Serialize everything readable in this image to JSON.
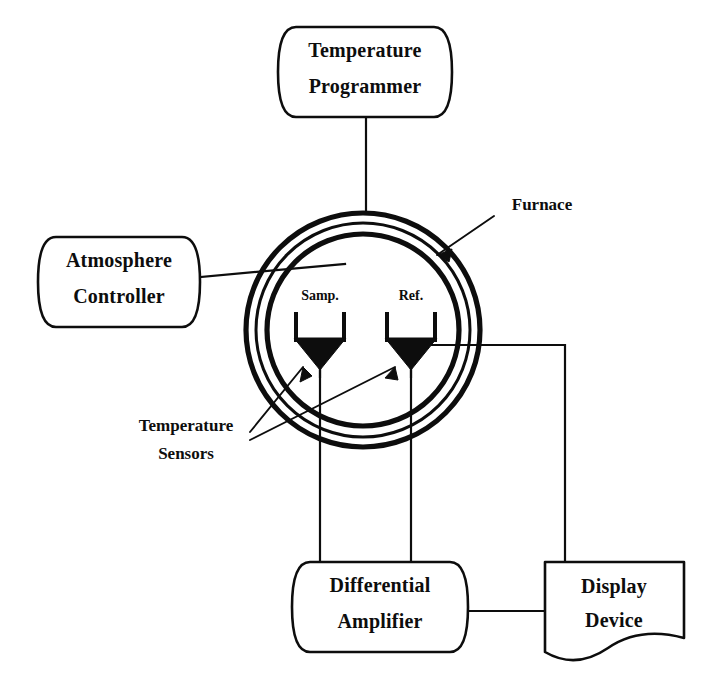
{
  "figure": {
    "background_color": "#ffffff",
    "ink_color": "#0d0d0d"
  },
  "blocks": [
    {
      "id": "temperature-programmer",
      "label_line1": "Temperature",
      "label_line2": "Programmer",
      "shape": "rounded-drum"
    },
    {
      "id": "atmosphere-controller",
      "label_line1": "Atmosphere",
      "label_line2": "Controller",
      "shape": "rounded-drum"
    },
    {
      "id": "differential-amplifier",
      "label_line1": "Differential",
      "label_line2": "Amplifier",
      "shape": "rounded-drum"
    },
    {
      "id": "display-device",
      "label_line1": "Display",
      "label_line2": "Device",
      "shape": "torn-paper"
    }
  ],
  "furnace": {
    "callout_label": "Furnace",
    "ring_count": 3
  },
  "crucibles": [
    {
      "id": "sample",
      "label": "Samp."
    },
    {
      "id": "reference",
      "label": "Ref."
    }
  ],
  "sensors": {
    "callout_line1": "Temperature",
    "callout_line2": "Sensors",
    "count": 2
  },
  "connections": [
    {
      "from": "temperature-programmer",
      "to": "furnace"
    },
    {
      "from": "atmosphere-controller",
      "to": "furnace"
    },
    {
      "from": "sample-sensor",
      "to": "differential-amplifier"
    },
    {
      "from": "reference-sensor",
      "to": "differential-amplifier"
    },
    {
      "from": "furnace",
      "to": "display-device"
    },
    {
      "from": "differential-amplifier",
      "to": "display-device"
    }
  ]
}
